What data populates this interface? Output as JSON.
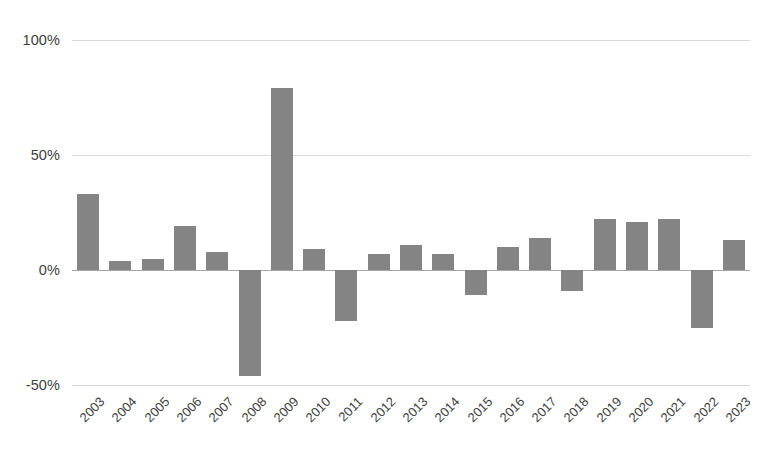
{
  "chart_data": {
    "type": "bar",
    "title": "",
    "subtitle": "",
    "xlabel": "",
    "ylabel": "",
    "categories": [
      "2003",
      "2004",
      "2005",
      "2006",
      "2007",
      "2008",
      "2009",
      "2010",
      "2011",
      "2012",
      "2013",
      "2014",
      "2015",
      "2016",
      "2017",
      "2018",
      "2019",
      "2020",
      "2021",
      "2022",
      "2023"
    ],
    "values": [
      33,
      4,
      5,
      19,
      8,
      -46,
      79,
      9,
      -22,
      7,
      11,
      7,
      -11,
      10,
      14,
      -9,
      22,
      21,
      22,
      -25,
      13
    ],
    "value_suffix": "%",
    "ylim": [
      -50,
      100
    ],
    "yticks": [
      100,
      50,
      0,
      -50
    ],
    "ytick_labels": [
      "100%",
      "50%",
      "0%",
      "-50%"
    ],
    "grid": true,
    "grid_axis": "y",
    "legend": false,
    "legend_position": "none",
    "bar_color": "#848484",
    "gridline_color": "#d9d9d9",
    "zeroline_color": "#a6a6a6",
    "background_color": "#ffffff",
    "tick_label_color": "#404040",
    "xlabel_rotation": -45
  }
}
